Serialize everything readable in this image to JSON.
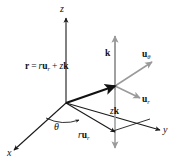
{
  "figure": {
    "background_color": "#ffffff",
    "dark_stroke": "#1a1a1a",
    "gray_stroke": "#9a9a9a",
    "bold_stroke": "#111111"
  },
  "axes": {
    "x_label": "x",
    "y_label": "y",
    "z_label": "z"
  },
  "angle": {
    "theta_label": "θ"
  },
  "vectors": {
    "position_equation": {
      "r_bold": "r",
      "equals": "=",
      "r_scalar": "r",
      "u_bold": "u",
      "u_sub": "r",
      "plus": "+",
      "z_scalar": "z",
      "k_bold": "k"
    },
    "k_label": {
      "bold": "k"
    },
    "u_theta_label": {
      "bold": "u",
      "sub": "θ"
    },
    "u_r_label": {
      "bold": "u",
      "sub": "r"
    },
    "zk_label": {
      "scalar": "z",
      "bold": "k"
    },
    "ru_r_label": {
      "scalar": "r",
      "bold": "u",
      "sub": "r"
    }
  }
}
